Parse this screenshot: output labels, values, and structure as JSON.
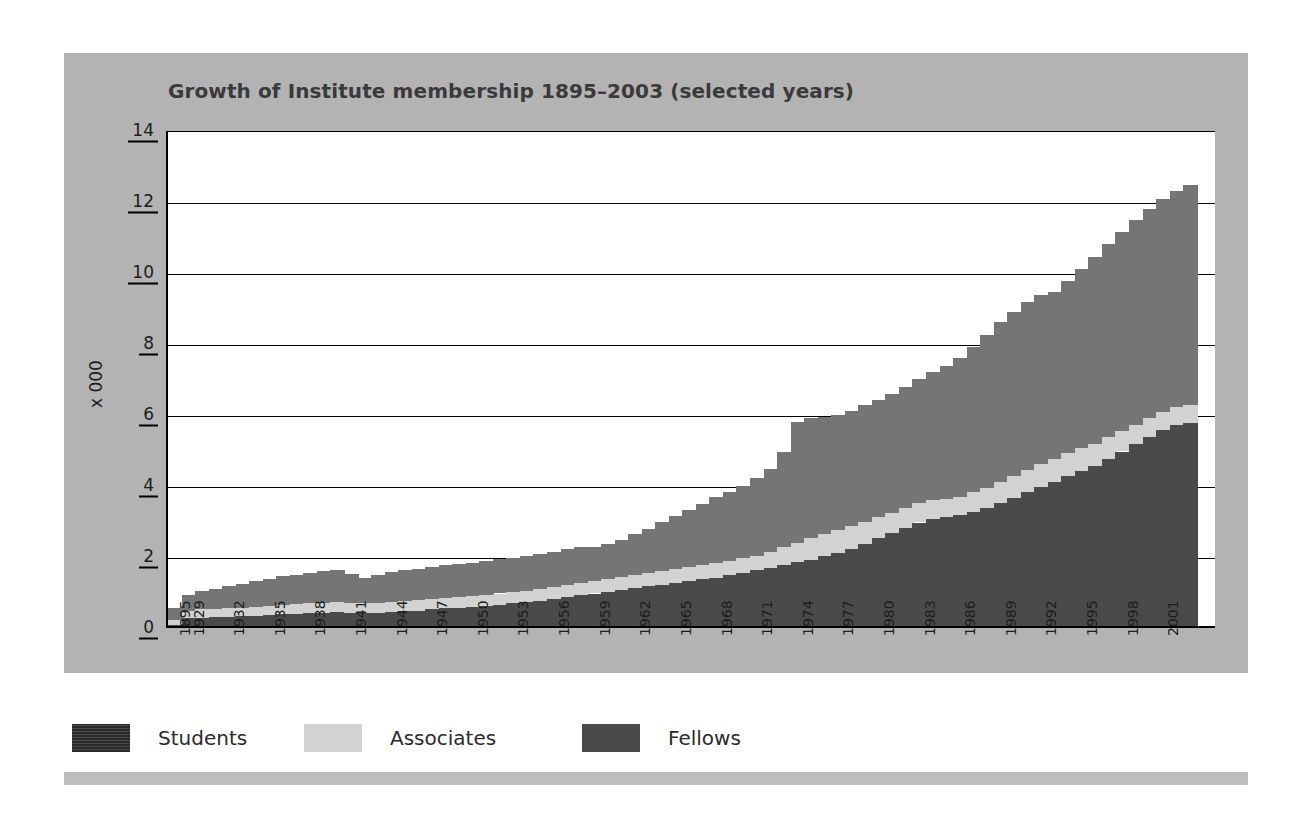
{
  "chart_data": {
    "type": "area",
    "title": "Growth of Institute membership 1895–2003 (selected years)",
    "xlabel": "",
    "ylabel": "x 000",
    "ylim": [
      0,
      14
    ],
    "ytick_values": [
      0,
      2,
      4,
      6,
      8,
      10,
      12,
      14
    ],
    "ytick_labels": [
      "0",
      "2",
      "4",
      "6",
      "8",
      "10",
      "12",
      "14"
    ],
    "grid": true,
    "legend_position": "bottom",
    "stack_order_bottom_to_top": [
      "Fellows",
      "Associates",
      "Students"
    ],
    "categories": [
      "1895",
      "1929",
      "1930",
      "1931",
      "1932",
      "1933",
      "1934",
      "1935",
      "1936",
      "1937",
      "1938",
      "1939",
      "1940",
      "1941",
      "1942",
      "1943",
      "1944",
      "1945",
      "1946",
      "1947",
      "1948",
      "1949",
      "1950",
      "1951",
      "1952",
      "1953",
      "1954",
      "1955",
      "1956",
      "1957",
      "1958",
      "1959",
      "1960",
      "1961",
      "1962",
      "1963",
      "1964",
      "1965",
      "1966",
      "1967",
      "1968",
      "1969",
      "1970",
      "1971",
      "1972",
      "1973",
      "1974",
      "1975",
      "1976",
      "1977",
      "1978",
      "1979",
      "1980",
      "1981",
      "1982",
      "1983",
      "1984",
      "1985",
      "1986",
      "1987",
      "1988",
      "1989",
      "1990",
      "1991",
      "1992",
      "1993",
      "1994",
      "1995",
      "1996",
      "1997",
      "1998",
      "1999",
      "2000",
      "2001",
      "2002",
      "2003"
    ],
    "tick_labels": [
      "1895",
      "1929",
      "1932",
      "1935",
      "1938",
      "1941",
      "1944",
      "1947",
      "1950",
      "1953",
      "1956",
      "1959",
      "1962",
      "1965",
      "1968",
      "1971",
      "1974",
      "1977",
      "1980",
      "1983",
      "1986",
      "1989",
      "1992",
      "1995",
      "1998",
      "2001"
    ],
    "series": [
      {
        "name": "Fellows",
        "color": "#4a4a4a",
        "values": [
          0.1,
          0.3,
          0.32,
          0.33,
          0.35,
          0.36,
          0.38,
          0.4,
          0.42,
          0.43,
          0.45,
          0.46,
          0.47,
          0.46,
          0.45,
          0.46,
          0.48,
          0.5,
          0.52,
          0.55,
          0.58,
          0.6,
          0.62,
          0.65,
          0.68,
          0.72,
          0.75,
          0.8,
          0.85,
          0.9,
          0.95,
          1.0,
          1.05,
          1.1,
          1.15,
          1.2,
          1.25,
          1.3,
          1.35,
          1.4,
          1.45,
          1.52,
          1.58,
          1.65,
          1.72,
          1.8,
          1.88,
          1.95,
          2.05,
          2.15,
          2.25,
          2.4,
          2.55,
          2.7,
          2.85,
          3.0,
          3.1,
          3.15,
          3.2,
          3.3,
          3.4,
          3.55,
          3.7,
          3.85,
          4.0,
          4.15,
          4.3,
          4.45,
          4.6,
          4.8,
          5.0,
          5.2,
          5.4,
          5.6,
          5.75,
          5.8
        ]
      },
      {
        "name": "Associates",
        "color": "#d2d2d2",
        "values": [
          0.15,
          0.22,
          0.23,
          0.23,
          0.24,
          0.24,
          0.25,
          0.26,
          0.26,
          0.27,
          0.27,
          0.27,
          0.28,
          0.28,
          0.28,
          0.28,
          0.29,
          0.29,
          0.3,
          0.3,
          0.3,
          0.31,
          0.31,
          0.31,
          0.32,
          0.32,
          0.33,
          0.33,
          0.34,
          0.34,
          0.35,
          0.35,
          0.36,
          0.36,
          0.37,
          0.37,
          0.38,
          0.38,
          0.39,
          0.39,
          0.4,
          0.4,
          0.41,
          0.42,
          0.45,
          0.5,
          0.55,
          0.6,
          0.62,
          0.63,
          0.64,
          0.62,
          0.6,
          0.58,
          0.56,
          0.55,
          0.53,
          0.52,
          0.52,
          0.55,
          0.58,
          0.6,
          0.62,
          0.63,
          0.64,
          0.65,
          0.65,
          0.64,
          0.62,
          0.6,
          0.58,
          0.56,
          0.54,
          0.52,
          0.5,
          0.5
        ]
      },
      {
        "name": "Students",
        "color": "#757575",
        "values": [
          0.35,
          0.45,
          0.52,
          0.58,
          0.63,
          0.68,
          0.72,
          0.76,
          0.8,
          0.83,
          0.87,
          0.9,
          0.92,
          0.8,
          0.72,
          0.78,
          0.83,
          0.86,
          0.88,
          0.9,
          0.92,
          0.93,
          0.94,
          0.95,
          0.96,
          0.96,
          0.97,
          0.97,
          0.98,
          1.0,
          1.02,
          0.95,
          0.98,
          1.05,
          1.15,
          1.25,
          1.38,
          1.5,
          1.62,
          1.74,
          1.86,
          1.95,
          2.05,
          2.18,
          2.35,
          2.7,
          3.4,
          3.38,
          3.3,
          3.25,
          3.25,
          3.28,
          3.3,
          3.35,
          3.42,
          3.5,
          3.6,
          3.75,
          3.92,
          4.1,
          4.3,
          4.5,
          4.62,
          4.72,
          4.76,
          4.7,
          4.85,
          5.05,
          5.25,
          5.45,
          5.6,
          5.75,
          5.9,
          6.0,
          6.1,
          6.2
        ]
      }
    ],
    "totals_note": "Values in thousands (x 000); final year total ≈ 12.5"
  },
  "legend": {
    "items": [
      {
        "label": "Students",
        "swatch": "students-swatch"
      },
      {
        "label": "Associates",
        "swatch": "associates-swatch"
      },
      {
        "label": "Fellows",
        "swatch": "fellows-swatch"
      }
    ]
  },
  "colors": {
    "panel": "#b3b3b3",
    "plot_background": "#ffffff",
    "axis": "#000000",
    "title_text": "#3a3a3a",
    "footer_bar": "#bdbdbd"
  }
}
